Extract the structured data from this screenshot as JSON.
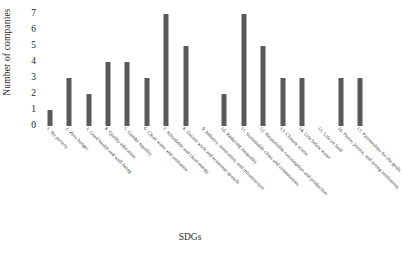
{
  "chart_data": {
    "type": "bar",
    "title": "",
    "xlabel": "SDGs",
    "ylabel": "Number of companies",
    "ylim": [
      0,
      7
    ],
    "yticks": [
      0,
      1,
      2,
      3,
      4,
      5,
      6,
      7
    ],
    "grid": false,
    "legend": null,
    "bar_color": "#595959",
    "categories": [
      "1. No poverty",
      "2. Zero hunger",
      "3. Good health and well-being",
      "4. Quality education",
      "5. Gender equality",
      "6. Clean water and sanitation",
      "7. Affordable and clean energy",
      "8. Decent work and economic growth",
      "9. Industry, innovation, and infrastructure",
      "10. Reducing inequality",
      "11. Sustainable cities and communities",
      "12. Responsible consumption and production",
      "13. Climate action",
      "14. Life below water",
      "15. Life on land",
      "16. Peace, justice, and strong institutions",
      "17. Partnerships for the goals"
    ],
    "values": [
      1,
      3,
      2,
      4,
      4,
      3,
      7,
      5,
      0,
      2,
      7,
      5,
      3,
      3,
      0,
      3,
      3
    ]
  }
}
